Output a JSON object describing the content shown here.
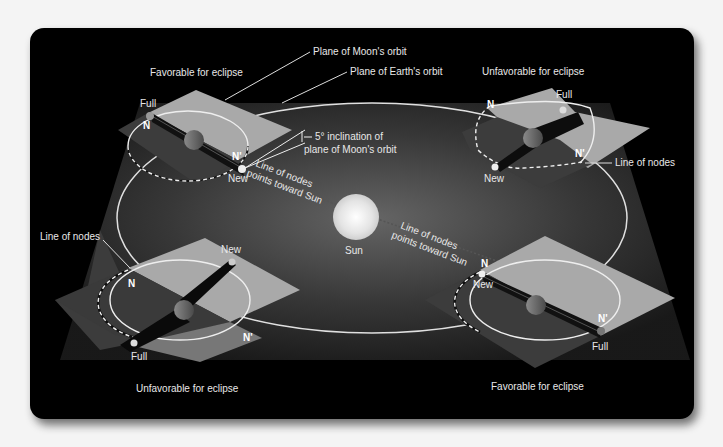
{
  "diagram": {
    "colors": {
      "panel": "#050505",
      "earth_plane": "#3a3a3a",
      "moon_plane_light": "#a8a8a8",
      "moon_plane_dark": "#404040",
      "orbit_line": "#e8e8e8",
      "sun": "#e6e6e6",
      "text": "#e8e8e8"
    },
    "center": {
      "sun_label": "Sun",
      "line_of_nodes_upper": [
        "Line of nodes",
        "points toward Sun"
      ],
      "line_of_nodes_lower": [
        "Line of nodes",
        "points toward Sun"
      ]
    },
    "callouts": {
      "moon_plane": "Plane of Moon's orbit",
      "earth_plane": "Plane of Earth's orbit",
      "inclination_line1": "5° inclination of",
      "inclination_line2": "plane of Moon's orbit"
    },
    "configurations": [
      {
        "position": "top-left",
        "caption": "Favorable for eclipse",
        "labels": {
          "full": "Full",
          "new": "New",
          "node_n": "N",
          "node_n_prime": "N'"
        }
      },
      {
        "position": "top-right",
        "caption": "Unfavorable for eclipse",
        "labels": {
          "full": "Full",
          "new": "New",
          "node_n": "N",
          "node_n_prime": "N'",
          "line_of_nodes": "Line of nodes"
        }
      },
      {
        "position": "bottom-left",
        "caption": "Unfavorable for eclipse",
        "labels": {
          "full": "Full",
          "new": "New",
          "node_n": "N",
          "node_n_prime": "N'",
          "line_of_nodes": "Line of nodes"
        }
      },
      {
        "position": "bottom-right",
        "caption": "Favorable for eclipse",
        "labels": {
          "full": "Full",
          "new": "New",
          "node_n": "N",
          "node_n_prime": "N'"
        }
      }
    ]
  }
}
